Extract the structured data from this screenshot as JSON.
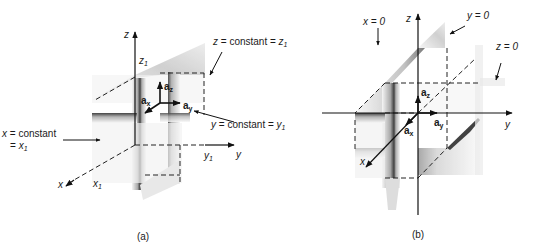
{
  "figure_a": {
    "caption": "(a)",
    "axes": {
      "z": "z",
      "y": "y",
      "x": "x"
    },
    "ticks": {
      "z1": "z",
      "z1_sub": "1",
      "y1": "y",
      "y1_sub": "1",
      "x1": "x",
      "x1_sub": "1"
    },
    "unit_vectors": {
      "ax": "a",
      "ax_sub": "x",
      "ay": "a",
      "ay_sub": "y",
      "az": "a",
      "az_sub": "z"
    },
    "annotations": {
      "z_plane_var": "z",
      "z_plane_text": " = constant = ",
      "z_plane_val": "z",
      "z_plane_sub": "1",
      "y_plane_var": "y",
      "y_plane_text": " = constant = ",
      "y_plane_val": "y",
      "y_plane_sub": "1",
      "x_plane_var": "x",
      "x_plane_text": " = constant",
      "x_plane_line2_prefix": "= ",
      "x_plane_val": "x",
      "x_plane_sub": "1"
    }
  },
  "figure_b": {
    "caption": "(b)",
    "axes": {
      "z": "z",
      "y": "y",
      "x": "x"
    },
    "unit_vectors": {
      "ax": "a",
      "ax_sub": "x",
      "ay": "a",
      "ay_sub": "y",
      "az": "a",
      "az_sub": "z"
    },
    "annotations": {
      "x_plane": "x = 0",
      "y_plane": "y = 0",
      "z_plane": "z = 0"
    }
  }
}
